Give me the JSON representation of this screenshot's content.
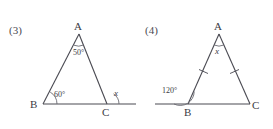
{
  "page": {
    "background_color": "#ffffff",
    "ink_color": "#3b3b43",
    "width": 273,
    "height": 129
  },
  "figures": [
    {
      "id": "figure-3",
      "number_label": "(3)",
      "shape": "triangle",
      "description": "Triangle ABC with base BC extended beyond C; angle at A is 50 degrees, angle at B is 60 degrees, exterior angle at C is x",
      "vertices": [
        {
          "name": "A",
          "label": "A",
          "x": 79,
          "y": 34
        },
        {
          "name": "B",
          "label": "B",
          "x": 43,
          "y": 104
        },
        {
          "name": "C",
          "label": "C",
          "x": 107,
          "y": 104
        }
      ],
      "base_extension": {
        "from_x": 43,
        "to_x": 136,
        "y": 104
      },
      "angles": [
        {
          "at": "A",
          "label": "50°",
          "italic": false,
          "has_arc": true
        },
        {
          "at": "B",
          "label": "60°",
          "italic": false,
          "has_arc": true
        },
        {
          "at": "C",
          "label": "x",
          "italic": true,
          "has_arc": true,
          "type": "exterior"
        }
      ],
      "tick_marks": []
    },
    {
      "id": "figure-4",
      "number_label": "(4)",
      "shape": "triangle",
      "description": "Isosceles triangle ABC with equal sides AB and AC marked by single ticks; base BC extended to the left of B; exterior angle at B is 120 degrees, apex angle at A is x",
      "vertices": [
        {
          "name": "A",
          "label": "A",
          "x": 83,
          "y": 34
        },
        {
          "name": "B",
          "label": "B",
          "x": 52,
          "y": 104
        },
        {
          "name": "C",
          "label": "C",
          "x": 114,
          "y": 104
        }
      ],
      "base_extension": {
        "from_x": 19,
        "to_x": 114,
        "y": 104
      },
      "angles": [
        {
          "at": "A",
          "label": "x",
          "italic": true,
          "has_arc": true
        },
        {
          "at": "B",
          "label": "120°",
          "italic": false,
          "has_arc": true,
          "type": "exterior"
        }
      ],
      "tick_marks": [
        {
          "on_side": "AB",
          "count": 1
        },
        {
          "on_side": "AC",
          "count": 1
        }
      ]
    }
  ]
}
